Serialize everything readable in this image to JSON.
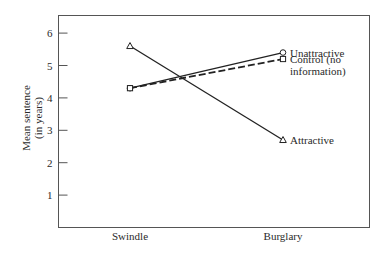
{
  "chart_data": {
    "type": "line",
    "title": "",
    "xlabel": "",
    "ylabel": "Mean sentence (in years)",
    "ylabel_lines": [
      "Mean sentence",
      "(in years)"
    ],
    "ylim": [
      0,
      6.5
    ],
    "yticks": [
      1,
      2,
      3,
      4,
      5,
      6
    ],
    "ytick_labels": [
      "1",
      "2",
      "3",
      "4",
      "5",
      "6"
    ],
    "categories": [
      "Swindle",
      "Burglary"
    ],
    "grid": false,
    "legend_position": "inline labels at right end of each line",
    "series": [
      {
        "name": "Unattractive",
        "values": [
          4.3,
          5.4
        ],
        "marker": "circle",
        "line": "solid"
      },
      {
        "name": "Control (no information)",
        "label_lines": [
          "Control (no",
          "information)"
        ],
        "values": [
          4.3,
          5.2
        ],
        "marker": "square",
        "line": "dashed"
      },
      {
        "name": "Attractive",
        "values": [
          5.6,
          2.7
        ],
        "marker": "triangle",
        "line": "solid"
      }
    ]
  }
}
